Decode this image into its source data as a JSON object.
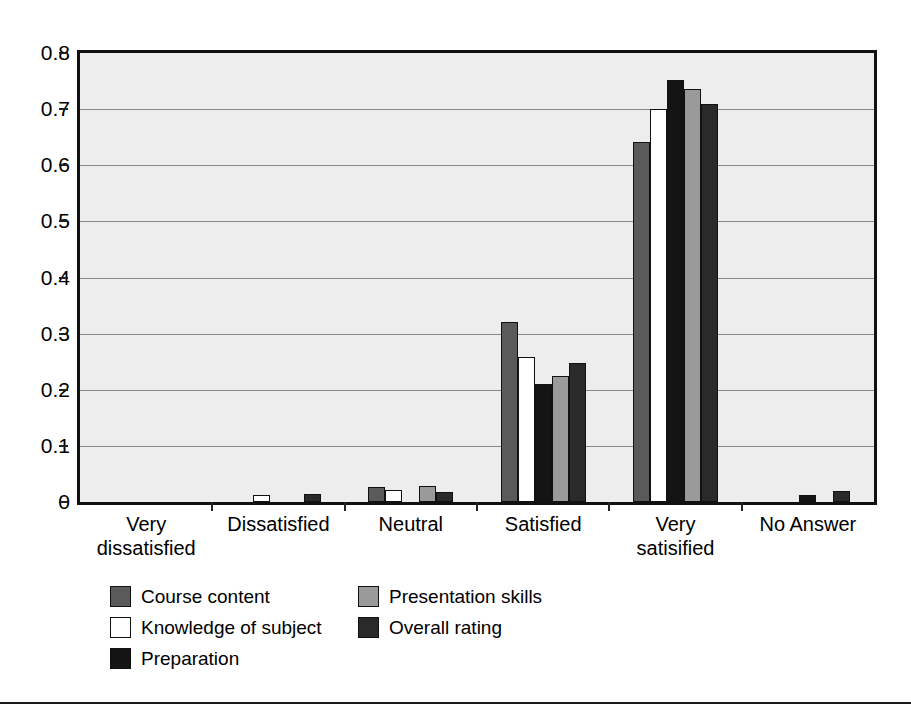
{
  "chart_data": {
    "type": "bar",
    "title": "",
    "subtitle": "",
    "xlabel": "",
    "ylabel": "",
    "ylim": [
      0,
      0.8
    ],
    "ytick_labels": [
      "0.8",
      "0.7",
      "0.6",
      "0.5",
      "0.4",
      "0.3",
      "0.2",
      "0.1",
      "0"
    ],
    "ytick_values": [
      0.8,
      0.7,
      0.6,
      0.5,
      0.4,
      0.3,
      0.2,
      0.1,
      0
    ],
    "grid": true,
    "grid_axis": "y",
    "legend_position": "bottom-left",
    "categories": [
      "Very dissatisfied",
      "Dissatisfied",
      "Neutral",
      "Satisfied",
      "Very satisified",
      "No Answer"
    ],
    "category_lines": [
      [
        "Very",
        "dissatisfied"
      ],
      [
        "Dissatisfied"
      ],
      [
        "Neutral"
      ],
      [
        "Satisfied"
      ],
      [
        "Very",
        "satisified"
      ],
      [
        "No Answer"
      ]
    ],
    "series": [
      {
        "name": "Course content",
        "color": "#5a5a5a",
        "values": [
          0,
          0,
          0.027,
          0.32,
          0.642,
          0
        ]
      },
      {
        "name": "Knowledge of subject",
        "color": "#ffffff",
        "values": [
          0,
          0.013,
          0.022,
          0.258,
          0.7,
          0
        ]
      },
      {
        "name": "Preparation",
        "color": "#141414",
        "values": [
          0,
          0,
          0,
          0.21,
          0.752,
          0.013
        ]
      },
      {
        "name": "Presentation skills",
        "color": "#9a9a9a",
        "values": [
          0,
          0,
          0.029,
          0.225,
          0.735,
          0
        ]
      },
      {
        "name": "Overall rating",
        "color": "#2a2a2a",
        "values": [
          0,
          0.015,
          0.018,
          0.247,
          0.71,
          0.019
        ]
      }
    ]
  },
  "legend": {
    "column_left": [
      "Course content",
      "Knowledge of subject",
      "Preparation"
    ],
    "column_right": [
      "Presentation skills",
      "Overall rating"
    ]
  },
  "style": {
    "plot_background": "#ededed",
    "frame_color": "#111111",
    "grid_color": "#888888",
    "page_background": "#ffffff"
  }
}
